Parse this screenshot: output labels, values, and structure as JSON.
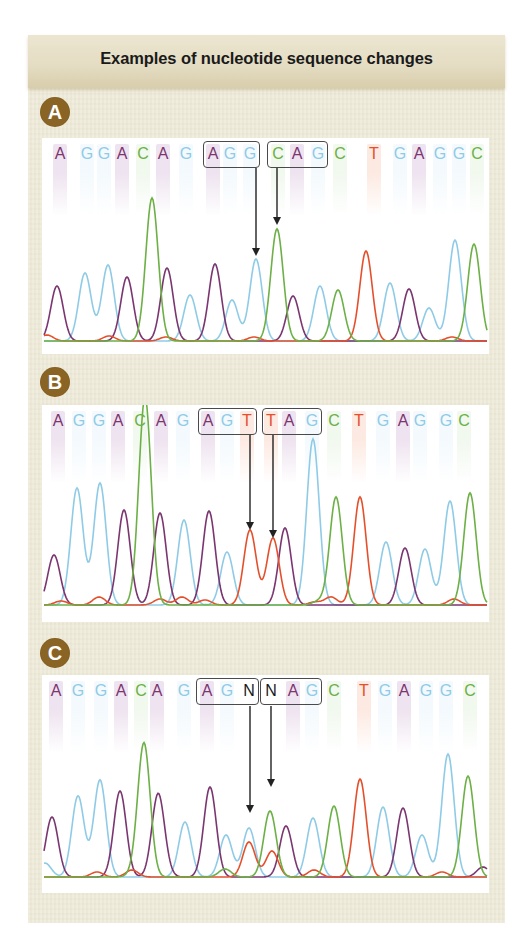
{
  "title": "Examples of nucleotide sequence changes",
  "base_colors": {
    "A": "#7b3570",
    "G": "#8fcbe6",
    "C": "#6cb046",
    "T": "#e4502c",
    "N": "#1a1a1a"
  },
  "shade_colors": {
    "A": "rgba(150,80,160,0.16)",
    "G": "rgba(140,200,235,0.10)",
    "C": "rgba(120,190,90,0.10)",
    "T": "rgba(240,120,70,0.16)",
    "N": "rgba(0,0,0,0)"
  },
  "panels": [
    {
      "label": "A",
      "badge": {
        "left": 12,
        "top": 62
      },
      "chart": {
        "top": 103,
        "height": 216,
        "baseline": 203
      },
      "sequence": [
        "A",
        "G",
        "G",
        "A",
        "C",
        "A",
        "G",
        "A",
        "G",
        "G",
        "C",
        "A",
        "G",
        "C",
        "T",
        "G",
        "A",
        "G",
        "G",
        "C"
      ],
      "letter_x": [
        18,
        45,
        62,
        80,
        101,
        121,
        144,
        171,
        188,
        208,
        236,
        255,
        276,
        298,
        332,
        358,
        377,
        398,
        417,
        435
      ],
      "boxes": [
        {
          "x1": 161,
          "x2": 218
        },
        {
          "x1": 225,
          "x2": 286
        }
      ],
      "arrows": [
        {
          "x": 214,
          "y1": 30,
          "y2": 118
        },
        {
          "x": 235,
          "y1": 30,
          "y2": 87
        }
      ],
      "peaks": [
        {
          "b": "A",
          "x": 15,
          "h": 55
        },
        {
          "b": "G",
          "x": 43,
          "h": 68
        },
        {
          "b": "G",
          "x": 66,
          "h": 76
        },
        {
          "b": "A",
          "x": 85,
          "h": 64
        },
        {
          "b": "C",
          "x": 110,
          "h": 143
        },
        {
          "b": "A",
          "x": 125,
          "h": 73
        },
        {
          "b": "G",
          "x": 148,
          "h": 46
        },
        {
          "b": "A",
          "x": 173,
          "h": 77
        },
        {
          "b": "G",
          "x": 190,
          "h": 41
        },
        {
          "b": "G",
          "x": 214,
          "h": 82
        },
        {
          "b": "C",
          "x": 235,
          "h": 112
        },
        {
          "b": "A",
          "x": 251,
          "h": 45
        },
        {
          "b": "G",
          "x": 278,
          "h": 55
        },
        {
          "b": "C",
          "x": 296,
          "h": 51
        },
        {
          "b": "T",
          "x": 324,
          "h": 90
        },
        {
          "b": "G",
          "x": 348,
          "h": 58
        },
        {
          "b": "A",
          "x": 367,
          "h": 52
        },
        {
          "b": "G",
          "x": 387,
          "h": 33
        },
        {
          "b": "G",
          "x": 413,
          "h": 101
        },
        {
          "b": "C",
          "x": 432,
          "h": 97
        },
        {
          "b": "T",
          "x": 5,
          "h": 6
        },
        {
          "b": "T",
          "x": 67,
          "h": 5
        },
        {
          "b": "T",
          "x": 124,
          "h": 4
        },
        {
          "b": "T",
          "x": 212,
          "h": 4
        },
        {
          "b": "T",
          "x": 410,
          "h": 4
        }
      ]
    },
    {
      "label": "B",
      "badge": {
        "left": 12,
        "top": 332
      },
      "chart": {
        "top": 370,
        "height": 217,
        "baseline": 200
      },
      "sequence": [
        "A",
        "G",
        "G",
        "A",
        "C",
        "A",
        "G",
        "A",
        "G",
        "T",
        "T",
        "A",
        "G",
        "C",
        "T",
        "G",
        "A",
        "G",
        "G",
        "C"
      ],
      "letter_x": [
        16,
        37,
        57,
        76,
        98,
        119,
        141,
        166,
        185,
        205,
        229,
        247,
        270,
        292,
        317,
        341,
        361,
        378,
        404,
        422
      ],
      "boxes": [
        {
          "x1": 156,
          "x2": 215
        },
        {
          "x1": 220,
          "x2": 280
        }
      ],
      "arrows": [
        {
          "x": 208,
          "y1": 30,
          "y2": 125
        },
        {
          "x": 231,
          "y1": 30,
          "y2": 133
        }
      ],
      "peaks": [
        {
          "b": "A",
          "x": 12,
          "h": 50
        },
        {
          "b": "G",
          "x": 35,
          "h": 117
        },
        {
          "b": "G",
          "x": 58,
          "h": 122
        },
        {
          "b": "A",
          "x": 82,
          "h": 95
        },
        {
          "b": "C",
          "x": 103,
          "h": 208
        },
        {
          "b": "A",
          "x": 118,
          "h": 92
        },
        {
          "b": "G",
          "x": 142,
          "h": 85
        },
        {
          "b": "A",
          "x": 167,
          "h": 94
        },
        {
          "b": "G",
          "x": 185,
          "h": 53
        },
        {
          "b": "T",
          "x": 208,
          "h": 75
        },
        {
          "b": "T",
          "x": 231,
          "h": 67
        },
        {
          "b": "A",
          "x": 243,
          "h": 77
        },
        {
          "b": "G",
          "x": 271,
          "h": 166
        },
        {
          "b": "C",
          "x": 294,
          "h": 108
        },
        {
          "b": "T",
          "x": 318,
          "h": 108
        },
        {
          "b": "G",
          "x": 344,
          "h": 63
        },
        {
          "b": "A",
          "x": 363,
          "h": 57
        },
        {
          "b": "G",
          "x": 383,
          "h": 56
        },
        {
          "b": "G",
          "x": 408,
          "h": 104
        },
        {
          "b": "C",
          "x": 428,
          "h": 112
        },
        {
          "b": "T",
          "x": 19,
          "h": 4
        },
        {
          "b": "T",
          "x": 57,
          "h": 8
        },
        {
          "b": "T",
          "x": 118,
          "h": 6
        },
        {
          "b": "T",
          "x": 140,
          "h": 8
        },
        {
          "b": "T",
          "x": 163,
          "h": 5
        },
        {
          "b": "T",
          "x": 273,
          "h": 3
        },
        {
          "b": "T",
          "x": 289,
          "h": 8
        },
        {
          "b": "T",
          "x": 412,
          "h": 6
        },
        {
          "b": "C",
          "x": 277,
          "h": 4
        }
      ]
    },
    {
      "label": "C",
      "badge": {
        "left": 12,
        "top": 603
      },
      "chart": {
        "top": 640,
        "height": 218,
        "baseline": 202
      },
      "sequence": [
        "A",
        "G",
        "G",
        "A",
        "C",
        "A",
        "G",
        "A",
        "G",
        "N",
        "N",
        "A",
        "G",
        "C",
        "T",
        "G",
        "A",
        "G",
        "G",
        "C"
      ],
      "letter_x": [
        14,
        36,
        59,
        79,
        99,
        115,
        142,
        165,
        185,
        207,
        229,
        251,
        270,
        292,
        322,
        343,
        362,
        384,
        404,
        428
      ],
      "boxes": [
        {
          "x1": 154,
          "x2": 217
        },
        {
          "x1": 218,
          "x2": 280
        }
      ],
      "arrows": [
        {
          "x": 208,
          "y1": 31,
          "y2": 138
        },
        {
          "x": 229,
          "y1": 31,
          "y2": 112
        }
      ],
      "peaks": [
        {
          "b": "A",
          "x": 10,
          "h": 60
        },
        {
          "b": "G",
          "x": 36,
          "h": 81
        },
        {
          "b": "G",
          "x": 58,
          "h": 97
        },
        {
          "b": "A",
          "x": 78,
          "h": 86
        },
        {
          "b": "C",
          "x": 102,
          "h": 133
        },
        {
          "b": "A",
          "x": 116,
          "h": 81
        },
        {
          "b": "G",
          "x": 143,
          "h": 55
        },
        {
          "b": "A",
          "x": 168,
          "h": 90
        },
        {
          "b": "G",
          "x": 184,
          "h": 42
        },
        {
          "b": "G",
          "x": 207,
          "h": 49
        },
        {
          "b": "T",
          "x": 207,
          "h": 35
        },
        {
          "b": "C",
          "x": 228,
          "h": 66
        },
        {
          "b": "T",
          "x": 230,
          "h": 26
        },
        {
          "b": "A",
          "x": 244,
          "h": 51
        },
        {
          "b": "G",
          "x": 271,
          "h": 59
        },
        {
          "b": "C",
          "x": 292,
          "h": 71
        },
        {
          "b": "T",
          "x": 318,
          "h": 93
        },
        {
          "b": "G",
          "x": 341,
          "h": 70
        },
        {
          "b": "A",
          "x": 361,
          "h": 69
        },
        {
          "b": "G",
          "x": 380,
          "h": 42
        },
        {
          "b": "G",
          "x": 406,
          "h": 123
        },
        {
          "b": "C",
          "x": 426,
          "h": 101
        },
        {
          "b": "G",
          "x": 3,
          "h": 14
        },
        {
          "b": "T",
          "x": 55,
          "h": 5
        },
        {
          "b": "T",
          "x": 90,
          "h": 7
        },
        {
          "b": "C",
          "x": 93,
          "h": 4
        },
        {
          "b": "A",
          "x": 123,
          "h": 5
        },
        {
          "b": "C",
          "x": 183,
          "h": 8
        },
        {
          "b": "T",
          "x": 272,
          "h": 7
        },
        {
          "b": "T",
          "x": 319,
          "h": 5
        },
        {
          "b": "T",
          "x": 400,
          "h": 5
        },
        {
          "b": "A",
          "x": 441,
          "h": 10
        }
      ]
    }
  ]
}
